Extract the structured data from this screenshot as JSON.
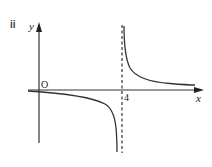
{
  "part_label": "ii",
  "axes": {
    "x_label": "x",
    "y_label": "y",
    "origin_label": "O"
  },
  "asymptote": {
    "x_value": "4",
    "style": "dashed"
  },
  "curve": {
    "description": "Rectangular hyperbola with vertical asymptote x = 4 and horizontal asymptote y = 0",
    "left_branch": "below x-axis, approaching y=0 as x→−∞ and −∞ as x→4⁻",
    "right_branch": "above x-axis, approaching +∞ as x→4⁺ and y=0 as x→+∞"
  }
}
